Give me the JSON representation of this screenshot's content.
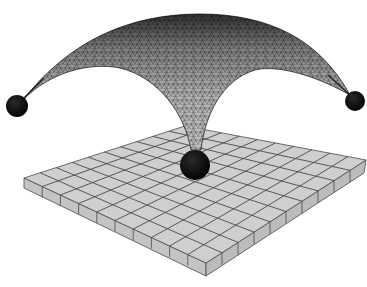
{
  "figure": {
    "colors": {
      "background": "#ffffff",
      "plate_top": "#cfcfcf",
      "plate_side_left": "#c4c4c4",
      "plate_side_right": "#bcbcbc",
      "grid_line": "#4a4a4a",
      "mesh_fill": "#bdbdbd",
      "mesh_line": "#2a2a2a",
      "ball": "#050505"
    },
    "plate": {
      "grid_rows": 10,
      "grid_cols": 10,
      "corners": {
        "left": [
          24,
          178
        ],
        "back": [
          185,
          126
        ],
        "right": [
          366,
          160
        ],
        "front": [
          206,
          263
        ]
      },
      "thickness_px": 13
    },
    "supports": [
      {
        "name": "left-support",
        "cx": 17,
        "cy": 106,
        "r": 11
      },
      {
        "name": "right-support",
        "cx": 355,
        "cy": 101,
        "r": 10
      },
      {
        "name": "center-support",
        "cx": 195,
        "cy": 165,
        "r": 15
      }
    ],
    "dome": {
      "apex": [
        200,
        14
      ],
      "base_point": [
        195,
        150
      ]
    }
  }
}
